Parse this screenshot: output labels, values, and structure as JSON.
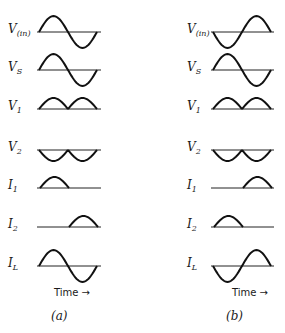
{
  "diagram": {
    "columns": [
      {
        "id": "a",
        "caption": "(a)",
        "time_label": "Time",
        "rows": [
          {
            "main": "V",
            "sub": "(in)",
            "shape": "sine_pos_first"
          },
          {
            "main": "V",
            "sub": "S",
            "shape": "sine_pos_first"
          },
          {
            "main": "V",
            "sub": "1",
            "shape": "full_rect_up"
          },
          {
            "main": "V",
            "sub": "2",
            "shape": "full_rect_down"
          },
          {
            "main": "I",
            "sub": "1",
            "shape": "half_first"
          },
          {
            "main": "I",
            "sub": "2",
            "shape": "half_second"
          },
          {
            "main": "I",
            "sub": "L",
            "shape": "sine_pos_first"
          }
        ]
      },
      {
        "id": "b",
        "caption": "(b)",
        "time_label": "Time",
        "rows": [
          {
            "main": "V",
            "sub": "(in)",
            "shape": "sine_neg_first"
          },
          {
            "main": "V",
            "sub": "S",
            "shape": "sine_pos_first"
          },
          {
            "main": "V",
            "sub": "1",
            "shape": "full_rect_up"
          },
          {
            "main": "V",
            "sub": "2",
            "shape": "full_rect_down"
          },
          {
            "main": "I",
            "sub": "1",
            "shape": "half_second"
          },
          {
            "main": "I",
            "sub": "2",
            "shape": "half_first"
          },
          {
            "main": "I",
            "sub": "L",
            "shape": "sine_neg_first"
          }
        ]
      }
    ],
    "arrow_glyph": "→",
    "stroke_color": "#111111"
  }
}
